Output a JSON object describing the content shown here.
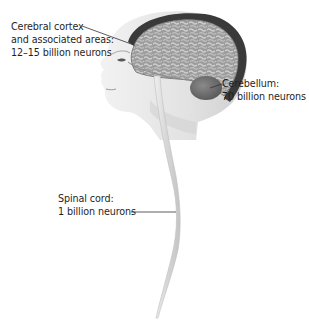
{
  "figure": {
    "type": "anatomical-illustration"
  },
  "labels": {
    "cortex": {
      "line1": "Cerebral cortex",
      "line2": "and associated areas:",
      "line3": "12–15 billion neurons"
    },
    "cerebellum": {
      "line1": "Cerebellum:",
      "line2": "70 billion neurons"
    },
    "spinal_cord": {
      "line1": "Spinal cord:",
      "line2": "1 billion neurons"
    }
  },
  "colors": {
    "text": "#1f1f1f",
    "leader_line": "#333333",
    "skin": "#e8e8e8",
    "cortex": "#9a9a9a",
    "cortex_folds": "#c4c4c4",
    "skull_rim": "#3a3a3a",
    "cerebellum": "#6f6f6f",
    "spinal_cord": "#dcdcdc"
  }
}
